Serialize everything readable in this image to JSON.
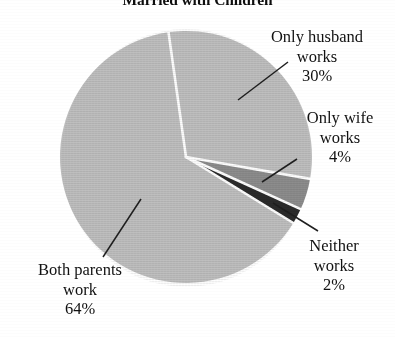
{
  "chart_data": {
    "type": "pie",
    "title": "Married with Children",
    "categories": [
      "Only husband works",
      "Only wife works",
      "Neither works",
      "Both parents work"
    ],
    "values": [
      30,
      4,
      2,
      64
    ],
    "value_labels": [
      "30%",
      "4%",
      "2%",
      "64%"
    ],
    "units": "percent",
    "legend": "none (direct labels with leader lines)",
    "slice_colors": [
      "#bfbfbf",
      "#8d8d8d",
      "#2b2b2b",
      "#bfbfbf"
    ],
    "separator_color": "#ffffff",
    "start_angle_deg": -98,
    "direction": "clockwise",
    "grid": false,
    "xlabel": "",
    "ylabel": ""
  },
  "title": {
    "text": "Married with Children"
  },
  "labels": {
    "husband": {
      "line1": "Only husband",
      "line2": "works",
      "value": "30%"
    },
    "wife": {
      "line1": "Only wife",
      "line2": "works",
      "value": "4%"
    },
    "neither": {
      "line1": "Neither",
      "line2": "works",
      "value": "2%"
    },
    "both": {
      "line1": "Both parents",
      "line2": "work",
      "value": "64%"
    }
  }
}
